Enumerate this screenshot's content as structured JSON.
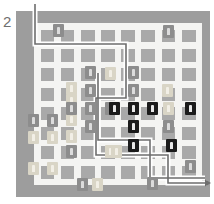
{
  "figure": {
    "panel_label": "2",
    "type": "city-grid-route-map",
    "background_color": "#ffffff"
  },
  "map": {
    "plate_color": "#9d9d9d",
    "street_color": "#f4f4f2",
    "block_color": "#a9a9a9",
    "grid_columns": 8,
    "grid_rows": 8,
    "plate": {
      "x": 16,
      "y": 11,
      "width": 194,
      "height": 186
    },
    "field": {
      "x": 18,
      "y": 12,
      "width": 168,
      "height": 162
    }
  },
  "legend_colors": {
    "marker_light": "#d9d5c6",
    "marker_mid": "#8d8d8d",
    "marker_dark": "#1b1b1b",
    "route_outer": "#ffffff",
    "route_inner": "#6e6e6e"
  },
  "chart_data": {
    "type": "scatter",
    "title": "2",
    "xlabel": "",
    "ylabel": "",
    "grid": true,
    "legend_position": "none",
    "xlim": [
      0,
      8
    ],
    "ylim": [
      0,
      8
    ],
    "categories": [
      "light",
      "mid",
      "dark"
    ],
    "series": [
      {
        "name": "light",
        "color": "#d9d5c6",
        "points": [
          {
            "cx": 33,
            "cy": 137
          },
          {
            "cx": 52,
            "cy": 137
          },
          {
            "cx": 71,
            "cy": 136
          },
          {
            "cx": 71,
            "cy": 119
          },
          {
            "cx": 71,
            "cy": 100
          },
          {
            "cx": 71,
            "cy": 88
          },
          {
            "cx": 33,
            "cy": 168
          },
          {
            "cx": 52,
            "cy": 168
          },
          {
            "cx": 97,
            "cy": 184
          },
          {
            "cx": 110,
            "cy": 151
          },
          {
            "cx": 110,
            "cy": 73
          },
          {
            "cx": 167,
            "cy": 90
          },
          {
            "cx": 168,
            "cy": 108
          },
          {
            "cx": 116,
            "cy": 151
          }
        ]
      },
      {
        "name": "mid",
        "color": "#8d8d8d",
        "points": [
          {
            "cx": 58,
            "cy": 30
          },
          {
            "cx": 168,
            "cy": 31
          },
          {
            "cx": 90,
            "cy": 72
          },
          {
            "cx": 90,
            "cy": 90
          },
          {
            "cx": 133,
            "cy": 72
          },
          {
            "cx": 133,
            "cy": 90
          },
          {
            "cx": 90,
            "cy": 108
          },
          {
            "cx": 71,
            "cy": 108
          },
          {
            "cx": 110,
            "cy": 108
          },
          {
            "cx": 190,
            "cy": 166
          },
          {
            "cx": 152,
            "cy": 183
          },
          {
            "cx": 82,
            "cy": 184
          },
          {
            "cx": 52,
            "cy": 120
          },
          {
            "cx": 33,
            "cy": 120
          },
          {
            "cx": 90,
            "cy": 126
          },
          {
            "cx": 71,
            "cy": 151
          },
          {
            "cx": 168,
            "cy": 126
          }
        ]
      },
      {
        "name": "dark",
        "color": "#1b1b1b",
        "points": [
          {
            "cx": 114,
            "cy": 108
          },
          {
            "cx": 133,
            "cy": 108
          },
          {
            "cx": 152,
            "cy": 108
          },
          {
            "cx": 190,
            "cy": 108
          },
          {
            "cx": 133,
            "cy": 126
          },
          {
            "cx": 133,
            "cy": 145
          },
          {
            "cx": 171,
            "cy": 145
          }
        ]
      }
    ],
    "route": {
      "name": "traversal-path",
      "entry": "top-left",
      "exit": "right-arrow",
      "stroke": "#6e6e6e",
      "halo": "#ffffff"
    }
  }
}
